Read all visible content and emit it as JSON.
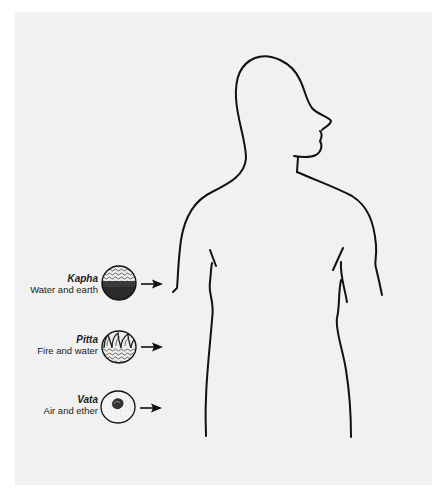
{
  "figure": {
    "background_color": "#f1f1f1",
    "margin_color": "#ffffff",
    "line_color": "#111111"
  },
  "doshas": [
    {
      "name": "Kapha",
      "elements": "Water and earth",
      "icon": "kapha-water-earth-icon"
    },
    {
      "name": "Pitta",
      "elements": "Fire and water",
      "icon": "pitta-fire-water-icon"
    },
    {
      "name": "Vata",
      "elements": "Air and ether",
      "icon": "vata-air-ether-icon"
    }
  ]
}
